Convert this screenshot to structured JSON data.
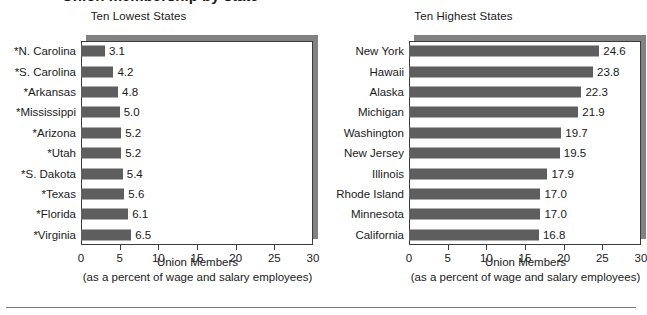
{
  "page": {
    "title_partial": "Union membership by state",
    "footer_rule": true
  },
  "axis": {
    "title": "Union Members",
    "subtitle": "(as a percent of wage and salary employees)",
    "ticks": [
      0,
      5,
      10,
      15,
      20,
      25,
      30
    ],
    "xmin": 0,
    "xmax": 30
  },
  "colors": {
    "bar": "#5e5e5e",
    "plot_shadow": "#828282",
    "frame": "#3c3c3c",
    "text": "#1a1a1a",
    "background": "#ffffff"
  },
  "chart_data": [
    {
      "type": "bar",
      "orientation": "horizontal",
      "title": "Ten Lowest States",
      "xlabel": "Union Members",
      "xlabel_note": "(as a percent of wage and salary employees)",
      "ylabel": "",
      "xlim": [
        0,
        30
      ],
      "xticks": [
        0,
        5,
        10,
        15,
        20,
        25,
        30
      ],
      "grid": false,
      "legend": "none",
      "data_labels": true,
      "categories": [
        "*N. Carolina",
        "*S. Carolina",
        "*Arkansas",
        "*Mississippi",
        "*Arizona",
        "*Utah",
        "*S. Dakota",
        "*Texas",
        "*Florida",
        "*Virginia"
      ],
      "values": [
        3.1,
        4.2,
        4.8,
        5.0,
        5.2,
        5.2,
        5.4,
        5.6,
        6.1,
        6.5
      ],
      "value_labels": [
        "3.1",
        "4.2",
        "4.8",
        "5.0",
        "5.2",
        "5.2",
        "5.4",
        "5.6",
        "6.1",
        "6.5"
      ]
    },
    {
      "type": "bar",
      "orientation": "horizontal",
      "title": "Ten Highest States",
      "xlabel": "Union Members",
      "xlabel_note": "(as a percent of wage and salary employees)",
      "ylabel": "",
      "xlim": [
        0,
        30
      ],
      "xticks": [
        0,
        5,
        10,
        15,
        20,
        25,
        30
      ],
      "grid": false,
      "legend": "none",
      "data_labels": true,
      "categories": [
        "New York",
        "Hawaii",
        "Alaska",
        "Michigan",
        "Washington",
        "New Jersey",
        "Illinois",
        "Rhode Island",
        "Minnesota",
        "California"
      ],
      "values": [
        24.6,
        23.8,
        22.3,
        21.9,
        19.7,
        19.5,
        17.9,
        17.0,
        17.0,
        16.8
      ],
      "value_labels": [
        "24.6",
        "23.8",
        "22.3",
        "21.9",
        "19.7",
        "19.5",
        "17.9",
        "17.0",
        "17.0",
        "16.8"
      ]
    }
  ]
}
